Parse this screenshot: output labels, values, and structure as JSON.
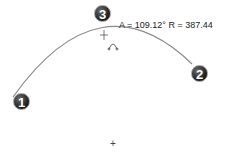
{
  "sketch": {
    "dimension_label": "A = 109.12° R = 387.44",
    "points": [
      {
        "id": "1",
        "label": "1"
      },
      {
        "id": "2",
        "label": "2"
      },
      {
        "id": "3",
        "label": "3"
      }
    ],
    "origin_symbol": "+",
    "colors": {
      "arc": "#8a8a8a",
      "badge": "#222222",
      "text": "#222222"
    }
  }
}
